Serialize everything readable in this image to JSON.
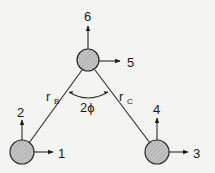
{
  "diagram": {
    "type": "three-mass triangular system with degrees of freedom",
    "nodes": [
      {
        "id": "top",
        "dof_horizontal": "5",
        "dof_vertical": "6"
      },
      {
        "id": "bottom-left",
        "dof_horizontal": "1",
        "dof_vertical": "2"
      },
      {
        "id": "bottom-right",
        "dof_horizontal": "3",
        "dof_vertical": "4"
      }
    ],
    "links": [
      {
        "label": "r",
        "subscript": "B"
      },
      {
        "label": "r",
        "subscript": "C"
      }
    ],
    "angle_label": "2ϕ"
  },
  "colors": {
    "node_fill": "#b8b8b8",
    "line": "#2a2a2a",
    "background": "#f4f4f2"
  }
}
